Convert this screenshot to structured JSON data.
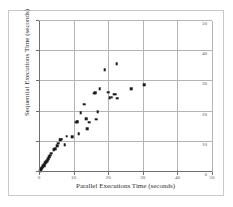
{
  "chart_data": {
    "type": "scatter",
    "title": "",
    "xlabel": "Parallel Executions Time (seconds)",
    "ylabel": "Sequential Executions Time (seconds)",
    "xlim": [
      0,
      50
    ],
    "ylim": [
      0,
      50
    ],
    "xticks": [
      0,
      10,
      20,
      30,
      40,
      50
    ],
    "yticks": [
      0,
      10,
      20,
      30,
      40,
      50
    ],
    "grid": true,
    "legend": null,
    "marker": "square",
    "marker_color": "#1a1a1a",
    "points": [
      [
        0.3,
        0.4
      ],
      [
        0.5,
        0.7
      ],
      [
        0.6,
        1.0
      ],
      [
        0.8,
        1.2
      ],
      [
        0.9,
        1.5
      ],
      [
        1.1,
        1.8
      ],
      [
        1.3,
        2.2
      ],
      [
        1.5,
        2.5
      ],
      [
        1.6,
        2.0
      ],
      [
        1.8,
        3.0
      ],
      [
        2.0,
        3.3
      ],
      [
        2.3,
        3.8
      ],
      [
        2.6,
        4.4
      ],
      [
        3.0,
        5.0
      ],
      [
        3.3,
        5.6
      ],
      [
        3.6,
        6.2
      ],
      [
        4.2,
        7.3
      ],
      [
        4.4,
        7.5
      ],
      [
        4.6,
        7.7
      ],
      [
        5.2,
        8.6
      ],
      [
        5.5,
        9.5
      ],
      [
        6.2,
        10.6
      ],
      [
        6.5,
        10.8
      ],
      [
        7.4,
        9.0
      ],
      [
        8.0,
        11.8
      ],
      [
        9.6,
        11.6
      ],
      [
        10.6,
        16.5
      ],
      [
        10.9,
        16.6
      ],
      [
        11.2,
        16.6
      ],
      [
        11.5,
        12.6
      ],
      [
        12.0,
        19.6
      ],
      [
        13.0,
        22.4
      ],
      [
        13.6,
        17.6
      ],
      [
        14.0,
        14.4
      ],
      [
        14.5,
        16.4
      ],
      [
        16.0,
        26.0
      ],
      [
        16.2,
        26.2
      ],
      [
        16.6,
        17.5
      ],
      [
        17.0,
        20.0
      ],
      [
        17.6,
        27.6
      ],
      [
        19.0,
        33.8
      ],
      [
        20.0,
        26.4
      ],
      [
        20.4,
        24.6
      ],
      [
        21.0,
        24.8
      ],
      [
        21.6,
        25.8
      ],
      [
        22.0,
        25.8
      ],
      [
        22.4,
        35.8
      ],
      [
        22.6,
        24.4
      ],
      [
        26.6,
        27.6
      ],
      [
        30.4,
        28.8
      ]
    ]
  }
}
